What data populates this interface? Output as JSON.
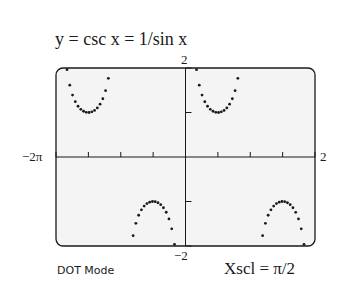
{
  "title": "y = csc x = 1/sin x",
  "labels": {
    "ymax": "2",
    "ymin": "−2",
    "xmin": "−2π",
    "xmax": "2",
    "mode": "DOT Mode",
    "xscl": "Xscl = π/2"
  },
  "colors": {
    "screen_bg": "#f4f4f4",
    "ink": "#1a1a1a"
  },
  "chart_data": {
    "type": "scatter",
    "title": "y = csc x = 1/sin x",
    "xlabel": "",
    "ylabel": "",
    "xlim": [
      -6.2832,
      6.2832
    ],
    "ylim": [
      -2,
      2
    ],
    "xscl": 1.5708,
    "yscl": 1,
    "grid": false,
    "mode": "DOT",
    "series": [
      {
        "name": "csc x",
        "function": "1/sin(x)"
      }
    ]
  }
}
